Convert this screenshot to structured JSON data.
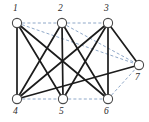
{
  "figure": {
    "type": "graph-diagram",
    "width": 149,
    "height": 122,
    "background_color": "#ffffff",
    "solid_edge_color": "#1c1c1c",
    "dashed_edge_color": "#8fa8c8"
  },
  "nodes": [
    {
      "id": "1",
      "label": "1",
      "x": 17,
      "y": 23,
      "r": 4.6,
      "label_x": 13,
      "label_y": 4
    },
    {
      "id": "2",
      "label": "2",
      "x": 62,
      "y": 23,
      "r": 4.6,
      "label_x": 58,
      "label_y": 4
    },
    {
      "id": "3",
      "label": "3",
      "x": 108,
      "y": 23,
      "r": 4.6,
      "label_x": 104,
      "label_y": 4
    },
    {
      "id": "4",
      "label": "4",
      "x": 17,
      "y": 99,
      "r": 4.6,
      "label_x": 13,
      "label_y": 107
    },
    {
      "id": "5",
      "label": "5",
      "x": 63,
      "y": 99,
      "r": 4.6,
      "label_x": 59,
      "label_y": 107
    },
    {
      "id": "6",
      "label": "6",
      "x": 108,
      "y": 99,
      "r": 4.6,
      "label_x": 104,
      "label_y": 107
    },
    {
      "id": "7",
      "label": "7",
      "x": 139,
      "y": 65,
      "r": 4.6,
      "label_x": 135,
      "label_y": 73
    }
  ],
  "edges_solid": [
    {
      "from": "1",
      "to": "4"
    },
    {
      "from": "1",
      "to": "5"
    },
    {
      "from": "1",
      "to": "6"
    },
    {
      "from": "2",
      "to": "4"
    },
    {
      "from": "2",
      "to": "5"
    },
    {
      "from": "2",
      "to": "6"
    },
    {
      "from": "3",
      "to": "4"
    },
    {
      "from": "3",
      "to": "5"
    },
    {
      "from": "3",
      "to": "6"
    },
    {
      "from": "3",
      "to": "7"
    },
    {
      "from": "4",
      "to": "7"
    }
  ],
  "edges_dashed": [
    {
      "from": "1",
      "to": "2"
    },
    {
      "from": "2",
      "to": "3"
    },
    {
      "from": "4",
      "to": "5"
    },
    {
      "from": "5",
      "to": "6"
    },
    {
      "from": "1",
      "to": "7"
    },
    {
      "from": "2",
      "to": "7"
    },
    {
      "from": "6",
      "to": "7"
    },
    {
      "from": "1",
      "to": "6"
    }
  ]
}
